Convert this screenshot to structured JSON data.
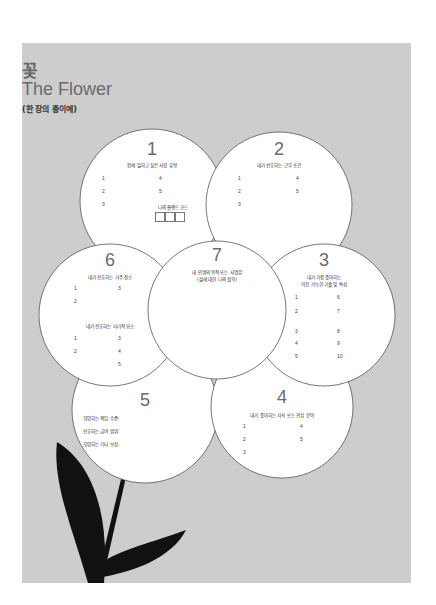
{
  "header": {
    "title_ko": "꽃",
    "title_en": "The Flower",
    "subtitle": "(한 장의 종이에)"
  },
  "colors": {
    "panel_bg": "#cdcdcd",
    "petal_fill": "#ffffff",
    "petal_stroke": "#555555",
    "stem_leaf": "#111111",
    "title_gray": "#6a6a6a"
  },
  "petals": {
    "p1": {
      "number": "1",
      "label": "함께 일하고 싶은 사람 유형",
      "items_left": [
        "1",
        "2",
        "3"
      ],
      "items_right": [
        "4",
        "5"
      ],
      "code_label": "나의 홀랜드 코드",
      "code_boxes": 3
    },
    "p2": {
      "number": "2",
      "label": "내가 선호하는 근무 조건",
      "items_left": [
        "1",
        "2",
        "3"
      ],
      "items_right": [
        "4",
        "5"
      ]
    },
    "p3": {
      "number": "3",
      "label_line1": "내가 가장 좋아하는",
      "label_line2": "이전 가능한 기술 및 특성",
      "items_left": [
        "1",
        "2",
        "3",
        "4",
        "5"
      ],
      "items_right": [
        "6",
        "7",
        "8",
        "9",
        "10"
      ]
    },
    "p4": {
      "number": "4",
      "label": "내가 좋아하는 지식 또는 관심 분야",
      "items_left": [
        "1",
        "2",
        "3"
      ],
      "items_right": [
        "4",
        "5"
      ]
    },
    "p5": {
      "number": "5",
      "label1": "희망하는 책임 수준:",
      "label2": "선호하는 급여 범위:",
      "label3": "희망하는 기타 보상:"
    },
    "p6": {
      "number": "6",
      "label_a": "내가 선호하는 거주 장소",
      "items_a_left": [
        "1",
        "2"
      ],
      "items_a_right": [
        "3"
      ],
      "label_b": "내가 선호하는 지리적 요소",
      "items_b_left": [
        "1",
        "2"
      ],
      "items_b_right": [
        "3",
        "4",
        "5"
      ]
    },
    "p7": {
      "number": "7",
      "label_line1": "내 인생의 목적 또는 사명감",
      "label_line2": "(삶에 대한 나의 철학)"
    }
  }
}
